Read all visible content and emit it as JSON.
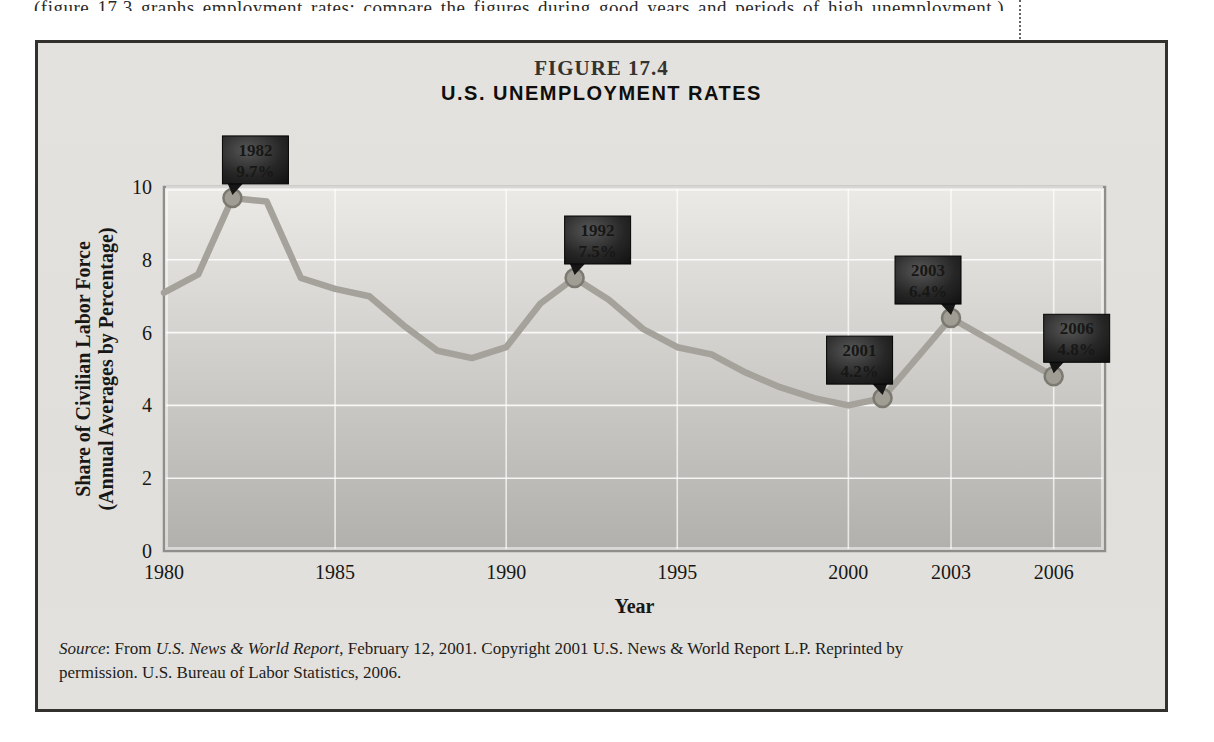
{
  "page": {
    "top_cropped_line": "(figure 17.3 graphs employment rates; compare the figures during good years and periods of high unemployment.)"
  },
  "figure": {
    "label": "FIGURE 17.4",
    "title": "U.S. UNEMPLOYMENT RATES",
    "source": {
      "prefix_italic": "Source",
      "prefix_rest": ": From ",
      "publication_italic": "U.S. News & World Report",
      "line1_rest": ", February 12, 2001. Copyright 2001 U.S. News & World Report L.P. Reprinted by",
      "line2": "permission. U.S. Bureau of Labor Statistics, 2006."
    }
  },
  "chart_data": {
    "type": "line",
    "title": "U.S. Unemployment Rates",
    "xlabel": "Year",
    "ylabel_line1": "Share of Civilian Labor Force",
    "ylabel_line2": "(Annual Averages by Percentage)",
    "x_domain": [
      1980,
      2007.5
    ],
    "ylim": [
      0,
      10
    ],
    "y_ticks": [
      0,
      2,
      4,
      6,
      8,
      10
    ],
    "x_ticks": [
      1980,
      1985,
      1990,
      1995,
      2000,
      2003,
      2006
    ],
    "grid": true,
    "legend": "none",
    "series": [
      {
        "name": "U.S. unemployment rate (%)",
        "points": [
          [
            1980,
            7.1
          ],
          [
            1981,
            7.6
          ],
          [
            1982,
            9.7
          ],
          [
            1983,
            9.6
          ],
          [
            1984,
            7.5
          ],
          [
            1985,
            7.2
          ],
          [
            1986,
            7.0
          ],
          [
            1987,
            6.2
          ],
          [
            1988,
            5.5
          ],
          [
            1989,
            5.3
          ],
          [
            1990,
            5.6
          ],
          [
            1991,
            6.8
          ],
          [
            1992,
            7.5
          ],
          [
            1993,
            6.9
          ],
          [
            1994,
            6.1
          ],
          [
            1995,
            5.6
          ],
          [
            1996,
            5.4
          ],
          [
            1997,
            4.9
          ],
          [
            1998,
            4.5
          ],
          [
            1999,
            4.2
          ],
          [
            2000,
            4.0
          ],
          [
            2001,
            4.2
          ],
          [
            2003,
            6.4
          ],
          [
            2006,
            4.8
          ]
        ]
      }
    ],
    "callouts": [
      {
        "year": 1982,
        "value": 9.7,
        "label_year": "1982",
        "label_value": "9.7%",
        "tail": "left"
      },
      {
        "year": 1992,
        "value": 7.5,
        "label_year": "1992",
        "label_value": "7.5%",
        "tail": "left"
      },
      {
        "year": 2001,
        "value": 4.2,
        "label_year": "2001",
        "label_value": "4.2%",
        "tail": "right"
      },
      {
        "year": 2003,
        "value": 6.4,
        "label_year": "2003",
        "label_value": "6.4%",
        "tail": "right"
      },
      {
        "year": 2006,
        "value": 4.8,
        "label_year": "2006",
        "label_value": "4.8%",
        "tail": "left"
      }
    ],
    "colors": {
      "line": "#a5a29b",
      "marker_fill": "#a09d94",
      "marker_stroke": "#7c7970",
      "plot_top": "#eceae6",
      "plot_bottom": "#b2b0ac",
      "plot_frame": "#908e8a",
      "grid": "#ffffff",
      "callout_bg_center": "#575757",
      "callout_bg_edge": "#0a0a0a",
      "callout_text": "#ffffff",
      "panel_bg": "#e2e0dc",
      "panel_border": "#33312e"
    }
  }
}
